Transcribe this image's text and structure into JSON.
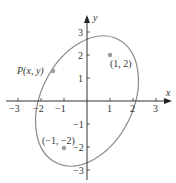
{
  "figure": {
    "type": "ellipse-with-foci",
    "colors": {
      "axis": "#333333",
      "ellipse": "#8a8a8a",
      "point": "#9a9a9a",
      "text": "#333333"
    },
    "axes": {
      "x_label": "x",
      "y_label": "y",
      "x_ticks": [
        "−3",
        "−2",
        "−1",
        "1",
        "2",
        "3"
      ],
      "y_ticks": [
        "3",
        "2",
        "1",
        "−1",
        "−2",
        "−3"
      ]
    },
    "points": [
      {
        "label": "(1, 2)",
        "x": 1,
        "y": 2
      },
      {
        "label": "(−1, −2)",
        "x": -1,
        "y": -2
      },
      {
        "label": "P(x, y)",
        "x": -1.35,
        "y": 1.3
      }
    ],
    "ellipse": {
      "center": [
        0,
        0
      ],
      "semi_major": 3,
      "semi_minor": 2,
      "angle_deg": 63.43
    }
  }
}
